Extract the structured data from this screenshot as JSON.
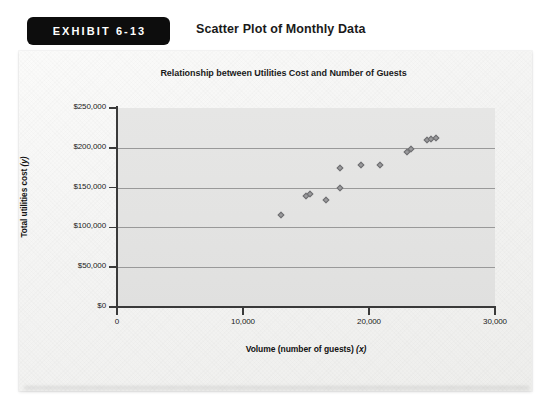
{
  "exhibit": {
    "badge_label": "EXHIBIT 6-13",
    "title": "Scatter Plot of Monthly Data"
  },
  "chart_data": {
    "type": "scatter",
    "title": "Relationship between Utilities Cost and Number of Guests",
    "xlabel": "Volume (number of guests) (x)",
    "ylabel": "Total utilities cost (y)",
    "xlim": [
      0,
      30000
    ],
    "ylim": [
      0,
      250000
    ],
    "xticks": [
      0,
      10000,
      20000,
      30000
    ],
    "xticklabels": [
      "0",
      "10,000",
      "20,000",
      "30,000"
    ],
    "yticks": [
      0,
      50000,
      100000,
      150000,
      200000,
      250000
    ],
    "yticklabels": [
      "$0",
      "$50,000",
      "$100,000",
      "$150,000",
      "$200,000",
      "$250,000"
    ],
    "grid": true,
    "grid_axis": "y",
    "legend": null,
    "marker": "diamond",
    "marker_color": "#9a9a9c",
    "plot_bg": "#e3e3e2",
    "points": [
      {
        "x": 13000,
        "y": 115000
      },
      {
        "x": 15000,
        "y": 139000
      },
      {
        "x": 15300,
        "y": 142000
      },
      {
        "x": 16600,
        "y": 135000
      },
      {
        "x": 17700,
        "y": 150000
      },
      {
        "x": 17700,
        "y": 175000
      },
      {
        "x": 19400,
        "y": 178000
      },
      {
        "x": 20900,
        "y": 178000
      },
      {
        "x": 23000,
        "y": 195000
      },
      {
        "x": 23300,
        "y": 198000
      },
      {
        "x": 24600,
        "y": 210000
      },
      {
        "x": 24900,
        "y": 211000
      },
      {
        "x": 25300,
        "y": 212000
      }
    ]
  }
}
